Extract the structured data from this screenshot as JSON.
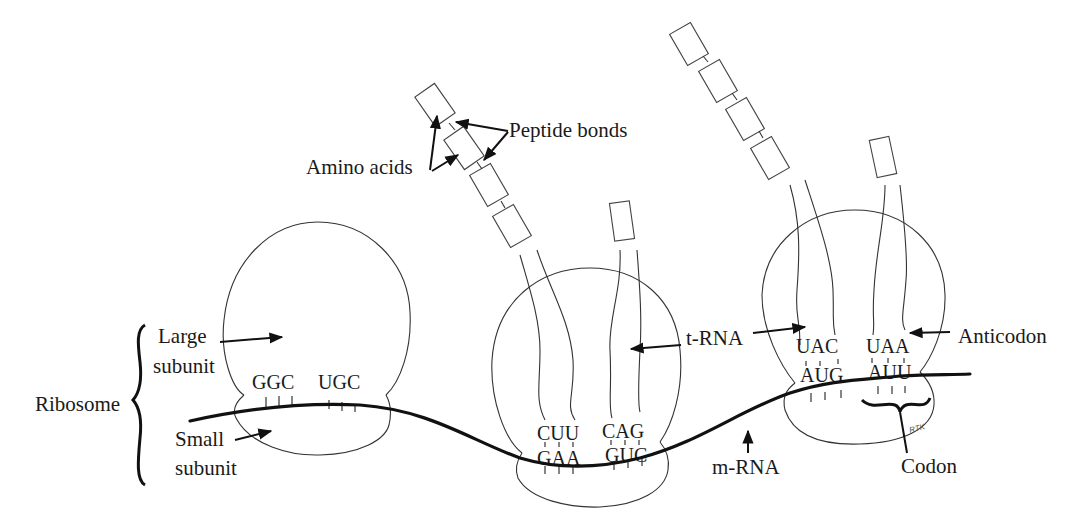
{
  "diagram": {
    "labels": {
      "ribosome": "Ribosome",
      "large_subunit_1": "Large",
      "large_subunit_2": "subunit",
      "small_subunit_1": "Small",
      "small_subunit_2": "subunit",
      "amino_acids": "Amino acids",
      "peptide_bonds": "Peptide bonds",
      "trna": "t-RNA",
      "anticodon": "Anticodon",
      "mrna": "m-RNA",
      "codon": "Codon",
      "signature": "RTK"
    },
    "ribosomes": [
      {
        "id": "ribosome-1",
        "exposed_bases": [
          "GGC",
          "UGC"
        ]
      },
      {
        "id": "ribosome-2",
        "anticodons": [
          "CUU",
          "CAG"
        ],
        "codons": [
          "GAA",
          "GUC"
        ]
      },
      {
        "id": "ribosome-3",
        "anticodons": [
          "UAC",
          "UAA"
        ],
        "codons": [
          "AUG",
          "AUU"
        ]
      }
    ],
    "colors": {
      "line": "#333333",
      "mrna": "#111111",
      "text": "#1a1a1a",
      "background": "#ffffff"
    }
  }
}
